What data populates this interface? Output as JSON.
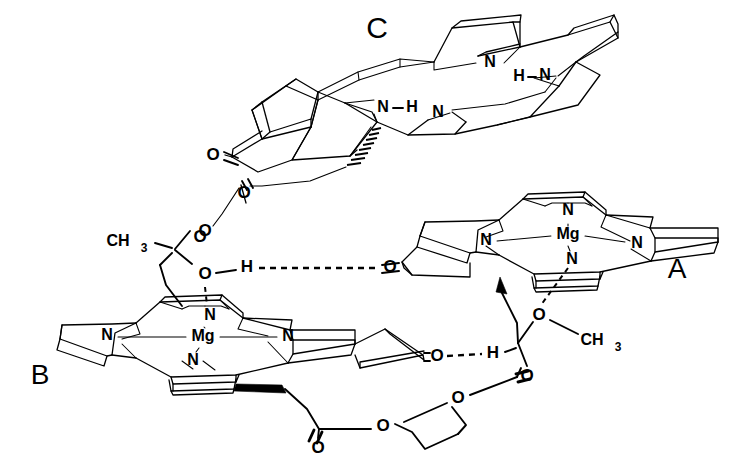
{
  "figure": {
    "kind": "chemical-structure-diagram",
    "background_color": "#ffffff",
    "line_color": "#000000",
    "width": 741,
    "height": 473
  },
  "ring_labels": [
    {
      "id": "label-c",
      "text": "C",
      "x": 377,
      "y": 30,
      "size": 30
    },
    {
      "id": "label-a",
      "text": "A",
      "x": 677,
      "y": 271,
      "size": 28
    },
    {
      "id": "label-b",
      "text": "B",
      "x": 40,
      "y": 377,
      "size": 28
    }
  ],
  "macrocycle_a": {
    "name": "A",
    "metal": {
      "text": "Mg",
      "x": 568,
      "y": 235,
      "size": 16
    },
    "nitrogens": [
      {
        "text": "N",
        "x": 568,
        "y": 211,
        "size": 16
      },
      {
        "text": "N",
        "x": 486,
        "y": 241,
        "size": 16
      },
      {
        "text": "N",
        "x": 637,
        "y": 244,
        "size": 16
      },
      {
        "text": "N",
        "x": 572,
        "y": 260,
        "size": 16
      }
    ],
    "substituents": {
      "keto_oxygen": {
        "text": "O",
        "x": 390,
        "y": 268,
        "size": 17
      },
      "methoxy_oxygen": {
        "text": "O",
        "x": 539,
        "y": 316,
        "size": 17
      },
      "methyl": {
        "text": "CH",
        "sub": "3",
        "x": 597,
        "y": 341,
        "size": 16
      },
      "ester_carbonyl_oxygen": {
        "text": "O",
        "x": 527,
        "y": 377,
        "size": 17
      },
      "ester_link_oxygen": {
        "text": "O",
        "x": 458,
        "y": 399,
        "size": 17
      }
    },
    "hydrogen_bond_h": {
      "text": "H",
      "x": 493,
      "y": 354,
      "size": 17
    }
  },
  "macrocycle_b": {
    "name": "B",
    "metal": {
      "text": "Mg",
      "x": 203,
      "y": 337,
      "size": 16
    },
    "nitrogens": [
      {
        "text": "N",
        "x": 210,
        "y": 316,
        "size": 16
      },
      {
        "text": "N",
        "x": 107,
        "y": 336,
        "size": 16
      },
      {
        "text": "N",
        "x": 288,
        "y": 337,
        "size": 16
      },
      {
        "text": "N",
        "x": 193,
        "y": 361,
        "size": 16
      }
    ],
    "substituents": {
      "keto_oxygen": {
        "text": "O",
        "x": 437,
        "y": 357,
        "size": 17
      },
      "methoxy_oxygen_upper": {
        "text": "O",
        "x": 200,
        "y": 238,
        "size": 17
      },
      "coordinating_oxygen": {
        "text": "O",
        "x": 205,
        "y": 275,
        "size": 17
      },
      "methyl": {
        "text": "CH",
        "sub": "3",
        "x": 139,
        "y": 242,
        "size": 16
      },
      "ester_carbonyl_oxygen": {
        "text": "O",
        "x": 318,
        "y": 449,
        "size": 17
      },
      "ester_link_oxygen": {
        "text": "O",
        "x": 383,
        "y": 427,
        "size": 17
      }
    },
    "hydrogen_bond_h": {
      "text": "H",
      "x": 247,
      "y": 268,
      "size": 17
    }
  },
  "macrocycle_c": {
    "name": "C",
    "free_base": true,
    "nitrogens": [
      {
        "text": "N",
        "x": 490,
        "y": 63,
        "size": 16
      },
      {
        "text": "N",
        "x": 383,
        "y": 108,
        "size": 16
      },
      {
        "text": "N",
        "x": 438,
        "y": 113,
        "size": 16
      },
      {
        "text": "N",
        "x": 545,
        "y": 76,
        "size": 16
      }
    ],
    "hydrogens": [
      {
        "text": "H",
        "x": 412,
        "y": 108,
        "size": 16
      },
      {
        "text": "H",
        "x": 519,
        "y": 77,
        "size": 16
      }
    ],
    "substituents": {
      "keto_oxygen": {
        "text": "O",
        "x": 213,
        "y": 156,
        "size": 17
      },
      "ester_carbonyl_oxygen": {
        "text": "O",
        "x": 244,
        "y": 194,
        "size": 17
      },
      "ester_link_oxygen": {
        "text": "O",
        "x": 205,
        "y": 232,
        "size": 17
      }
    }
  },
  "bonds_legend": {
    "hydrogen_bond": "dashed line between O and H",
    "coordination_bond": "dashed line between Mg-N and axial O",
    "stereo_wedge": "solid filled wedge",
    "stereo_hash": "hashed wedge"
  }
}
